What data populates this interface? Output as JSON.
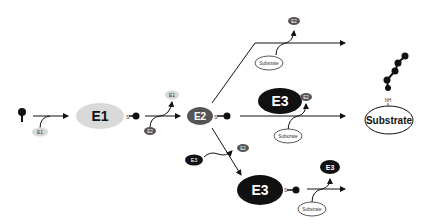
{
  "diagram": {
    "colors": {
      "e1": "#d9d9d9",
      "e2": "#555555",
      "e3": "#111111",
      "line": "#111111",
      "substrate_fill": "#ffffff"
    },
    "nodes": {
      "e1_main": "E1",
      "e1_in": "E1",
      "e1_out": "E1",
      "e2_main": "E2",
      "e2_in": "E2",
      "e2_out_top": "E2",
      "e2_out_mid": "E2",
      "e2_out_low": "E2",
      "e3_mid": "E3",
      "e3_low_small": "E3",
      "e3_low_main": "E3",
      "e3_low_out": "E3",
      "substrate_top": "Substrate",
      "substrate_mid": "Substrate",
      "substrate_low": "Substrate",
      "substrate_product": "Substrate",
      "thioester_s1": "S",
      "thioester_s2": "S",
      "thioester_s3": "S",
      "amide_nh": "NH"
    }
  }
}
